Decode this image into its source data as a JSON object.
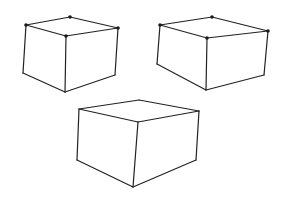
{
  "figure": {
    "stroke_color": "#222222",
    "background": "#ffffff"
  },
  "boxes": [
    {
      "name": "box-top-left",
      "vertices": {
        "top_back": [
          70,
          17
        ],
        "top_left": [
          26,
          25
        ],
        "top_front": [
          66,
          36
        ],
        "top_right": [
          118,
          28
        ],
        "bottom_left": [
          23,
          73
        ],
        "bottom_front": [
          65,
          92
        ],
        "bottom_right": [
          115,
          75
        ]
      },
      "marked_vertices": [
        "top_back",
        "top_left",
        "top_front",
        "top_right"
      ]
    },
    {
      "name": "box-top-right",
      "vertices": {
        "top_back": [
          212,
          17
        ],
        "top_left": [
          160,
          25
        ],
        "top_front": [
          207,
          38
        ],
        "top_right": [
          268,
          31
        ],
        "bottom_left": [
          157,
          64
        ],
        "bottom_front": [
          206,
          90
        ],
        "bottom_right": [
          264,
          75
        ]
      },
      "marked_vertices": [
        "top_back",
        "top_left",
        "top_front",
        "top_right"
      ]
    },
    {
      "name": "box-bottom-center",
      "vertices": {
        "top_back": [
          139,
          100
        ],
        "top_left": [
          79,
          109
        ],
        "top_front": [
          138,
          122
        ],
        "top_right": [
          199,
          111
        ],
        "bottom_left": [
          77,
          160
        ],
        "bottom_front": [
          133,
          187
        ],
        "bottom_right": [
          196,
          160
        ]
      },
      "marked_vertices": []
    }
  ]
}
